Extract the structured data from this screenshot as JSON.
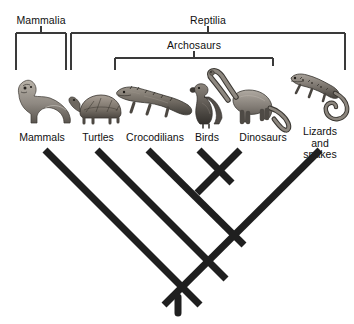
{
  "figure": {
    "background_color": "#ffffff",
    "bracket_color": "#3a3a3a",
    "branch_color": "#1f1f1f",
    "text_color": "#101010"
  },
  "clade_brackets": [
    {
      "name": "mammalia",
      "label": "Mammalia",
      "x_left": 16,
      "x_right": 66,
      "y_bar": 33,
      "tick_x": 41,
      "label_x": 41,
      "label_y": 14
    },
    {
      "name": "reptilia",
      "label": "Reptilia",
      "x_left": 71,
      "x_right": 345,
      "y_bar": 33,
      "tick_x": 208,
      "label_x": 208,
      "label_y": 14
    },
    {
      "name": "archosaurs",
      "label": "Archosaurs",
      "x_left": 115,
      "x_right": 273,
      "y_bar": 58,
      "tick_x": 194,
      "label_x": 194,
      "label_y": 39
    }
  ],
  "taxa": [
    {
      "name": "mammals",
      "label": "Mammals",
      "icon": "ferret-icon",
      "label_x": 42,
      "label_y": 132,
      "tip_x": 45,
      "drop_line_x": 41,
      "drop_line_y_top": 33,
      "drop_line_y_bottom": 70
    },
    {
      "name": "turtles",
      "label": "Turtles",
      "icon": "turtle-icon",
      "label_x": 98,
      "label_y": 132,
      "tip_x": 97,
      "drop_line_x": 96,
      "drop_line_y_top": 33,
      "drop_line_y_bottom": 70
    },
    {
      "name": "crocodilians",
      "label": "Crocodilians",
      "icon": "crocodile-icon",
      "label_x": 155,
      "label_y": 132,
      "tip_x": 148,
      "drop_line_x": 115,
      "drop_line_y_top": 58,
      "drop_line_y_bottom": 70
    },
    {
      "name": "birds",
      "label": "Birds",
      "icon": "bird-icon",
      "label_x": 207,
      "label_y": 132,
      "tip_x": 199,
      "drop_line_x": 194,
      "drop_line_y_top": 58,
      "drop_line_y_bottom": 66
    },
    {
      "name": "dinosaurs",
      "label": "Dinosaurs",
      "icon": "sauropod-icon",
      "label_x": 263,
      "label_y": 132,
      "tip_x": 240,
      "drop_line_x": 273,
      "drop_line_y_top": 58,
      "drop_line_y_bottom": 66
    },
    {
      "name": "lizards-and-snakes",
      "label": "Lizards and\nsnakes",
      "icon": "lizard-icon",
      "label_x": 320,
      "label_y": 126,
      "tip_x": 320,
      "drop_line_x": 345,
      "drop_line_y_top": 33,
      "drop_line_y_bottom": 70
    }
  ],
  "tree_nodes": [
    {
      "name": "root-node",
      "x": 178,
      "y": 305
    },
    {
      "name": "reptilia-node",
      "x": 152,
      "y": 279
    },
    {
      "name": "archosaur-plus-lizard-node",
      "x": 186,
      "y": 245
    },
    {
      "name": "archosaur-node",
      "x": 215,
      "y": 182
    }
  ],
  "tree_branches": [
    {
      "name": "mammals-branch",
      "from_x": 45,
      "from_y": 150,
      "to_x": 200,
      "to_y": 305
    },
    {
      "name": "turtles-branch",
      "from_x": 97,
      "from_y": 150,
      "to_x": 226,
      "to_y": 279
    },
    {
      "name": "crocodilians-branch",
      "from_x": 148,
      "from_y": 150,
      "to_x": 244,
      "to_y": 245
    },
    {
      "name": "birds-branch",
      "from_x": 199,
      "from_y": 150,
      "to_x": 232,
      "to_y": 182
    },
    {
      "name": "dinosaurs-branch",
      "from_x": 240,
      "from_y": 150,
      "to_x": 198,
      "to_y": 192
    },
    {
      "name": "lizards-branch",
      "from_x": 320,
      "from_y": 150,
      "to_x": 164,
      "to_y": 305
    }
  ]
}
